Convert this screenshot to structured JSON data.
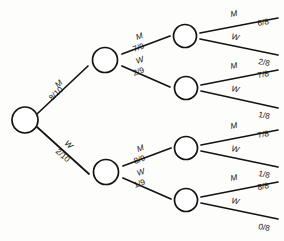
{
  "diagram": {
    "type": "probability-tree",
    "stroke_color": "#131313",
    "node_fill": "#ffffff",
    "background": "#fdfdfc",
    "outcome_labels": [
      "M",
      "W"
    ],
    "root": {
      "name": "root-node"
    },
    "level1": [
      {
        "name": "node-m",
        "edge_label": "M",
        "edge_prob": "8/10"
      },
      {
        "name": "node-w",
        "edge_label": "W",
        "edge_prob": "2/10"
      }
    ],
    "level2": [
      {
        "name": "node-mm",
        "edge_label": "M",
        "edge_prob": "7/9"
      },
      {
        "name": "node-mw",
        "edge_label": "W",
        "edge_prob": "2/9"
      },
      {
        "name": "node-wm",
        "edge_label": "M",
        "edge_prob": "8/9"
      },
      {
        "name": "node-ww",
        "edge_label": "W",
        "edge_prob": "1/9"
      }
    ],
    "level3": [
      {
        "name": "leaf-mmm",
        "edge_label": "M",
        "edge_prob": "6/8"
      },
      {
        "name": "leaf-mmw",
        "edge_label": "W",
        "edge_prob": "2/8"
      },
      {
        "name": "leaf-mwm",
        "edge_label": "M",
        "edge_prob": "7/8"
      },
      {
        "name": "leaf-mww",
        "edge_label": "W",
        "edge_prob": "1/8"
      },
      {
        "name": "leaf-wmm",
        "edge_label": "M",
        "edge_prob": "7/8"
      },
      {
        "name": "leaf-wmw",
        "edge_label": "W",
        "edge_prob": "1/8"
      },
      {
        "name": "leaf-wwm",
        "edge_label": "M",
        "edge_prob": "8/8"
      },
      {
        "name": "leaf-www",
        "edge_label": "W",
        "edge_prob": "0/8"
      }
    ]
  }
}
